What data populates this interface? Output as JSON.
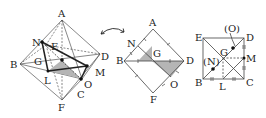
{
  "figure1": {
    "labels": {
      "A": "A",
      "B": "B",
      "C": "C",
      "D": "D",
      "E": "E",
      "F": "F",
      "G": "G",
      "L": "L",
      "M": "M",
      "N": "N",
      "O": "O"
    }
  },
  "arrow": {
    "icon": "double-headed-curved-arrow"
  },
  "figure2": {
    "labels": {
      "A": "A",
      "N": "N",
      "B": "B",
      "G": "G",
      "D": "D",
      "O": "O",
      "F": "F"
    },
    "shade_color": "#b5b5b5"
  },
  "figure3": {
    "labels": {
      "E": "E",
      "O": "(O)",
      "D": "D",
      "G": "G",
      "N": "(N)",
      "M": "M",
      "B": "B",
      "L": "L",
      "C": "C"
    }
  },
  "colors": {
    "line": "#333333",
    "thin": "#555555",
    "shade": "#b5b5b5",
    "bg": "#ffffff"
  }
}
